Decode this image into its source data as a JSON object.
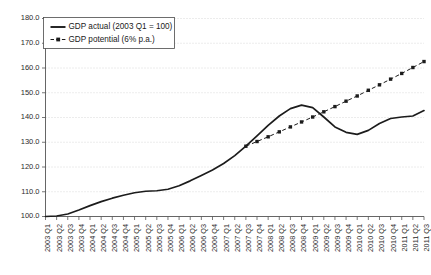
{
  "chart_data": {
    "type": "line",
    "title": "",
    "xlabel": "",
    "ylabel": "",
    "ylim": [
      100.0,
      180.0
    ],
    "ytick_step": 10.0,
    "grid": true,
    "legend_position": "top-left",
    "ytick_labels": [
      "100.0",
      "110.0",
      "120.0",
      "130.0",
      "140.0",
      "150.0",
      "160.0",
      "170.0",
      "180.0"
    ],
    "categories": [
      "2003 Q1",
      "2003 Q2",
      "2003 Q3",
      "2003 Q4",
      "2004 Q1",
      "2004 Q2",
      "2004 Q3",
      "2004 Q4",
      "2005 Q1",
      "2005 Q2",
      "2005 Q3",
      "2005 Q4",
      "2006 Q1",
      "2006 Q2",
      "2006 Q3",
      "2006 Q4",
      "2007 Q1",
      "2007 Q2",
      "2007 Q3",
      "2007 Q4",
      "2008 Q1",
      "2008 Q2",
      "2008 Q3",
      "2008 Q4",
      "2009 Q1",
      "2009 Q2",
      "2009 Q3",
      "2009 Q4",
      "2010 Q1",
      "2010 Q2",
      "2010 Q3",
      "2010 Q4",
      "2011 Q1",
      "2011 Q2",
      "2011 Q3"
    ],
    "series": [
      {
        "name": "GDP actual (2003 Q1 = 100)",
        "style": "solid",
        "marker": "none",
        "color": "#1c1c1c",
        "values": [
          100.0,
          100.2,
          101.0,
          102.6,
          104.4,
          106.0,
          107.4,
          108.6,
          109.6,
          110.2,
          110.4,
          111.0,
          112.4,
          114.4,
          116.6,
          118.8,
          121.4,
          124.6,
          128.4,
          132.6,
          136.8,
          140.6,
          143.6,
          145.0,
          144.0,
          140.2,
          136.2,
          134.0,
          133.2,
          134.8,
          137.6,
          139.6,
          140.2,
          140.6,
          142.8
        ]
      },
      {
        "name": "GDP potential (6% p.a.)",
        "style": "dashed",
        "marker": "square",
        "color": "#1c1c1c",
        "start_category": "2007 Q3",
        "values": [
          null,
          null,
          null,
          null,
          null,
          null,
          null,
          null,
          null,
          null,
          null,
          null,
          null,
          null,
          null,
          null,
          null,
          null,
          128.4,
          130.3,
          132.2,
          134.2,
          136.2,
          138.2,
          140.2,
          142.3,
          144.4,
          146.6,
          148.7,
          151.0,
          153.2,
          155.5,
          157.8,
          160.2,
          162.6
        ]
      }
    ]
  },
  "legend": {
    "items": [
      {
        "label": "GDP actual (2003 Q1 = 100)",
        "style": "solid"
      },
      {
        "label": "GDP potential (6% p.a.)",
        "style": "dashed-marker"
      }
    ]
  }
}
